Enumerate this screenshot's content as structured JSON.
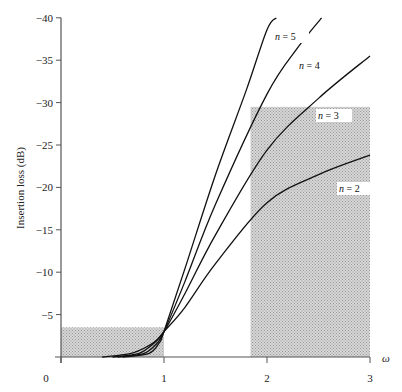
{
  "chart_data": {
    "type": "line",
    "title": "",
    "xlabel": "ω",
    "ylabel": "Insertion loss (dB)",
    "xlim": [
      0,
      3
    ],
    "ylim": [
      0,
      -40
    ],
    "x_ticks": [
      "0",
      "1",
      "2",
      "3"
    ],
    "y_ticks": [
      "0",
      "−5",
      "−10",
      "−15",
      "−20",
      "−25",
      "−30",
      "−35",
      "−40"
    ],
    "grid": false,
    "series": [
      {
        "name": "n = 2",
        "points": [
          [
            0.4,
            0
          ],
          [
            0.7,
            0.5
          ],
          [
            0.9,
            1.7
          ],
          [
            1.0,
            3.0
          ],
          [
            1.2,
            5.8
          ],
          [
            1.5,
            11.0
          ],
          [
            2.0,
            18.2
          ],
          [
            2.5,
            21.5
          ],
          [
            3.0,
            23.8
          ]
        ]
      },
      {
        "name": "n = 3",
        "points": [
          [
            0.5,
            0
          ],
          [
            0.75,
            0.4
          ],
          [
            0.9,
            1.6
          ],
          [
            1.0,
            3.0
          ],
          [
            1.2,
            7.4
          ],
          [
            1.5,
            14.4
          ],
          [
            2.0,
            24.4
          ],
          [
            2.5,
            30.5
          ],
          [
            3.0,
            35.5
          ]
        ]
      },
      {
        "name": "n = 4",
        "points": [
          [
            0.55,
            0
          ],
          [
            0.8,
            0.4
          ],
          [
            0.93,
            1.6
          ],
          [
            1.0,
            3.0
          ],
          [
            1.2,
            8.8
          ],
          [
            1.5,
            18.0
          ],
          [
            2.0,
            31.0
          ],
          [
            2.3,
            36.5
          ],
          [
            2.53,
            40.0
          ]
        ]
      },
      {
        "name": "n = 5",
        "points": [
          [
            0.6,
            0
          ],
          [
            0.85,
            0.4
          ],
          [
            0.95,
            1.6
          ],
          [
            1.0,
            3.0
          ],
          [
            1.2,
            10.3
          ],
          [
            1.5,
            21.5
          ],
          [
            1.8,
            31.5
          ],
          [
            2.0,
            38.6
          ],
          [
            2.09,
            40.0
          ]
        ]
      }
    ],
    "shaded_regions": [
      {
        "name": "passband",
        "x": [
          0,
          1.0
        ],
        "y": [
          0,
          3.5
        ]
      },
      {
        "name": "stopband",
        "x": [
          1.84,
          3.0
        ],
        "y": [
          0,
          29.5
        ]
      }
    ],
    "annotations": [
      "n = 5",
      "n = 4",
      "n = 3",
      "n = 2"
    ]
  }
}
